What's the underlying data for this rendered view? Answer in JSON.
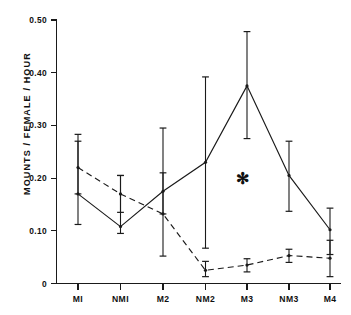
{
  "chart_data": {
    "type": "line",
    "title": "",
    "subtitle": "",
    "xlabel": "",
    "ylabel": "MOUNTS / FEMALE / HOUR",
    "categories": [
      "MI",
      "NMI",
      "M2",
      "NM2",
      "M3",
      "NM3",
      "M4"
    ],
    "ylim": [
      0,
      0.5
    ],
    "ytick_labels": [
      "0",
      "0.10",
      "0.20",
      "0.30",
      "0.40",
      "0.50"
    ],
    "ytick_values": [
      0,
      0.1,
      0.2,
      0.3,
      0.4,
      0.5
    ],
    "grid": false,
    "legend_position": "none",
    "series": [
      {
        "name": "solid",
        "line_style": "solid",
        "marker": "point",
        "values": [
          0.17,
          0.108,
          0.175,
          0.23,
          0.375,
          0.205,
          0.102
        ],
        "err_low": [
          0.112,
          0.095,
          0.132,
          0.067,
          0.275,
          0.137,
          0.055
        ],
        "err_high": [
          0.283,
          0.205,
          0.295,
          0.392,
          0.478,
          0.27,
          0.143
        ]
      },
      {
        "name": "dashed",
        "line_style": "dashed",
        "marker": "point",
        "values": [
          0.22,
          0.17,
          0.132,
          0.025,
          0.035,
          0.053,
          0.048
        ],
        "err_low": [
          0.17,
          0.135,
          0.052,
          0.013,
          0.022,
          0.04,
          0.013
        ],
        "err_high": [
          0.27,
          0.205,
          0.21,
          0.042,
          0.047,
          0.065,
          0.082
        ]
      }
    ],
    "annotations": [
      {
        "name": "significance-asterisk",
        "text": "✻",
        "x_category": "M3",
        "y_value": 0.2
      }
    ],
    "colors": {
      "axis": "#1a1a1a",
      "series_solid": "#1a1a1a",
      "series_dashed": "#1a1a1a",
      "background": "#ffffff"
    }
  }
}
